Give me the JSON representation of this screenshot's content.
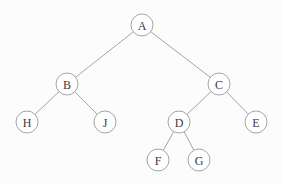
{
  "diagram": {
    "type": "binary-tree",
    "background_color": "#fcfcfc",
    "node_fill_color": "#ffffff",
    "node_stroke_color": "#9a9a9a",
    "edge_color": "#9a9a9a",
    "label_color": "#3a3a3a",
    "node_radius": 11,
    "nodes": [
      {
        "id": "A",
        "label": "A",
        "x": 142,
        "y": 25
      },
      {
        "id": "B",
        "label": "B",
        "x": 67,
        "y": 84
      },
      {
        "id": "C",
        "label": "C",
        "x": 219,
        "y": 84
      },
      {
        "id": "H",
        "label": "H",
        "x": 27,
        "y": 122
      },
      {
        "id": "J",
        "label": "J",
        "x": 105,
        "y": 122
      },
      {
        "id": "D",
        "label": "D",
        "x": 179,
        "y": 122
      },
      {
        "id": "E",
        "label": "E",
        "x": 256,
        "y": 122
      },
      {
        "id": "F",
        "label": "F",
        "x": 158,
        "y": 160
      },
      {
        "id": "G",
        "label": "G",
        "x": 199,
        "y": 160
      }
    ],
    "edges": [
      {
        "from": "A",
        "to": "B"
      },
      {
        "from": "A",
        "to": "C"
      },
      {
        "from": "B",
        "to": "H"
      },
      {
        "from": "B",
        "to": "J"
      },
      {
        "from": "C",
        "to": "D"
      },
      {
        "from": "C",
        "to": "E"
      },
      {
        "from": "D",
        "to": "F"
      },
      {
        "from": "D",
        "to": "G"
      }
    ]
  }
}
